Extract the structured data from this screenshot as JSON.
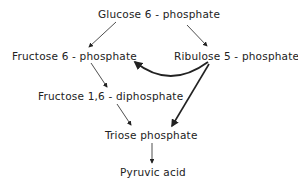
{
  "diagram": {
    "type": "metabolic-pathway",
    "nodes": {
      "glucose6p": "Glucose 6 - phosphate",
      "fructose6p": "Fructose  6 - phosphate",
      "ribulose5p": "Ribulose  5 - phosphate",
      "fructose16dp": "Fructose 1,6 - diphosphate",
      "triosep": "Triose  phosphate",
      "pyruvic": "Pyruvic acid"
    },
    "edges": [
      {
        "from": "glucose6p",
        "to": "fructose6p"
      },
      {
        "from": "glucose6p",
        "to": "ribulose5p"
      },
      {
        "from": "ribulose5p",
        "to": "fructose6p",
        "style": "bold-curved"
      },
      {
        "from": "fructose6p",
        "to": "fructose16dp"
      },
      {
        "from": "fructose16dp",
        "to": "triosep"
      },
      {
        "from": "ribulose5p",
        "to": "triosep",
        "style": "bold"
      },
      {
        "from": "triosep",
        "to": "pyruvic"
      }
    ],
    "colors": {
      "ink": "#222222",
      "background": "#ffffff"
    }
  }
}
